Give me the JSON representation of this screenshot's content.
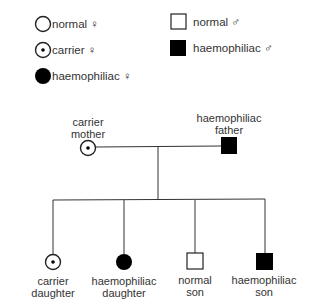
{
  "legend": {
    "female": [
      {
        "symbol": "open-circle",
        "label": "normal ♀"
      },
      {
        "symbol": "dotted-circle",
        "label": "carrier ♀"
      },
      {
        "symbol": "filled-circle",
        "label": "haemophiliac ♀"
      }
    ],
    "male": [
      {
        "symbol": "open-square",
        "label": "normal ♂"
      },
      {
        "symbol": "filled-square",
        "label": "haemophiliac ♂"
      }
    ]
  },
  "parents": {
    "mother": {
      "label_line1": "carrier",
      "label_line2": "mother",
      "symbol": "dotted-circle"
    },
    "father": {
      "label_line1": "haemophiliac",
      "label_line2": "father",
      "symbol": "filled-square"
    }
  },
  "children": [
    {
      "label_line1": "carrier",
      "label_line2": "daughter",
      "symbol": "dotted-circle"
    },
    {
      "label_line1": "haemophiliac",
      "label_line2": "daughter",
      "symbol": "filled-circle"
    },
    {
      "label_line1": "normal",
      "label_line2": "son",
      "symbol": "open-square"
    },
    {
      "label_line1": "haemophiliac",
      "label_line2": "son",
      "symbol": "filled-square"
    }
  ],
  "colors": {
    "line": "#333333",
    "fill": "#000000",
    "text": "#333333"
  }
}
